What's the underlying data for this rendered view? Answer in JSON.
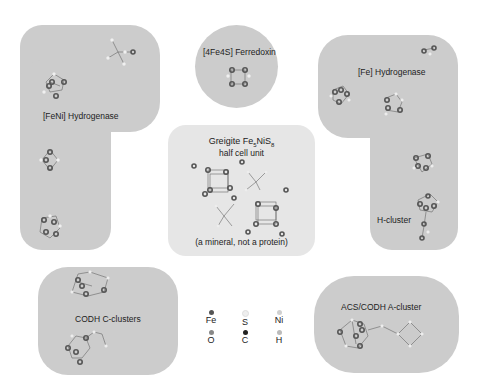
{
  "panels": {
    "feni": {
      "title": "[FeNi] Hydrogenase"
    },
    "ferredoxin": {
      "title": "[4Fe4S] Ferredoxin"
    },
    "fe_hydrogenase": {
      "title": "[Fe] Hydrogenase",
      "subtitle": "H-cluster"
    },
    "greigite": {
      "title_prefix": "Greigite Fe",
      "sub1": "5",
      "mid": "NiS",
      "sub2": "8",
      "line2": "half cell unit",
      "note": "(a mineral, not a protein)"
    },
    "codh": {
      "title": "CODH C-clusters"
    },
    "acs": {
      "title": "ACS/CODH A-cluster"
    }
  },
  "legend": {
    "items": [
      {
        "symbol": "Fe",
        "color": "#555555"
      },
      {
        "symbol": "S",
        "color": "#eeeeee"
      },
      {
        "symbol": "Ni",
        "color": "#d0d0d0"
      },
      {
        "symbol": "O",
        "color": "#888888"
      },
      {
        "symbol": "C",
        "color": "#222222"
      },
      {
        "symbol": "H",
        "color": "#bbbbbb"
      }
    ]
  },
  "colors": {
    "panel": "#cccccc",
    "light_panel": "#e6e6e6"
  }
}
